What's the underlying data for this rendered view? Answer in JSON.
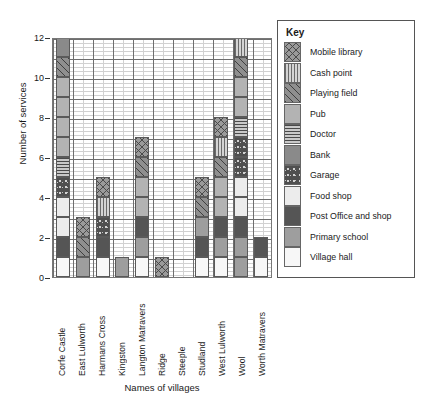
{
  "chart_data": {
    "type": "bar",
    "stacked": true,
    "title": "",
    "xlabel": "Names of villages",
    "ylabel": "Number of services",
    "ylim": [
      0,
      13
    ],
    "yticks": [
      0,
      2,
      4,
      6,
      8,
      10,
      12
    ],
    "grid": true,
    "legend_position": "right",
    "legend_title": "Key",
    "categories": [
      "Corfe Castle",
      "East Lulworth",
      "Harmans Cross",
      "Kingston",
      "Langton Matravers",
      "Ridge",
      "Steeple",
      "Studland",
      "West Lulworth",
      "Wool",
      "Worth Matravers"
    ],
    "totals": [
      12,
      3,
      5,
      1,
      7,
      1,
      0,
      5,
      8,
      12,
      2
    ],
    "series": [
      {
        "name": "Village hall",
        "key": "village-hall",
        "values": [
          1,
          0,
          1,
          0,
          1,
          0,
          0,
          1,
          1,
          0,
          1
        ]
      },
      {
        "name": "Primary school",
        "key": "primary-school",
        "values": [
          0,
          1,
          0,
          1,
          1,
          0,
          0,
          1,
          1,
          2,
          0
        ]
      },
      {
        "name": "Post Office and shop",
        "key": "post-office",
        "values": [
          1,
          0,
          1,
          0,
          1,
          0,
          0,
          1,
          1,
          1,
          1
        ]
      },
      {
        "name": "Food shop",
        "key": "food-shop",
        "values": [
          2,
          0,
          0,
          0,
          0,
          0,
          0,
          0,
          0,
          2,
          0
        ]
      },
      {
        "name": "Garage",
        "key": "garage",
        "values": [
          1,
          0,
          1,
          0,
          0,
          0,
          0,
          0,
          0,
          2,
          0
        ]
      },
      {
        "name": "Bank",
        "key": "bank",
        "values": [
          1,
          0,
          0,
          0,
          0,
          0,
          0,
          0,
          0,
          0,
          0
        ]
      },
      {
        "name": "Doctor",
        "key": "doctor",
        "values": [
          1,
          0,
          0,
          0,
          0,
          0,
          0,
          0,
          0,
          1,
          0
        ]
      },
      {
        "name": "Pub",
        "key": "pub",
        "values": [
          4,
          0,
          0,
          0,
          2,
          0,
          0,
          0,
          2,
          2,
          0
        ]
      },
      {
        "name": "Playing field",
        "key": "playing-field",
        "values": [
          1,
          1,
          0,
          0,
          1,
          0,
          0,
          1,
          1,
          1,
          0
        ]
      },
      {
        "name": "Cash point",
        "key": "cash-point",
        "values": [
          0,
          0,
          1,
          0,
          0,
          0,
          0,
          0,
          1,
          1,
          0
        ]
      },
      {
        "name": "Mobile library",
        "key": "mobile-library",
        "values": [
          0,
          1,
          1,
          0,
          1,
          1,
          0,
          1,
          1,
          0,
          0
        ]
      }
    ],
    "stacks": [
      {
        "village": "Corfe Castle",
        "segments": [
          "village-hall",
          "post-office",
          "food-shop",
          "food-shop",
          "garage",
          "doctor",
          "pub",
          "pub",
          "pub",
          "pub",
          "playing-field",
          "bank"
        ]
      },
      {
        "village": "East Lulworth",
        "segments": [
          "primary-school",
          "playing-field",
          "mobile-library"
        ]
      },
      {
        "village": "Harmans Cross",
        "segments": [
          "village-hall",
          "post-office",
          "garage",
          "cash-point",
          "mobile-library"
        ]
      },
      {
        "village": "Kingston",
        "segments": [
          "primary-school"
        ]
      },
      {
        "village": "Langton Matravers",
        "segments": [
          "village-hall",
          "primary-school",
          "post-office",
          "pub",
          "pub",
          "playing-field",
          "mobile-library"
        ]
      },
      {
        "village": "Ridge",
        "segments": [
          "mobile-library"
        ]
      },
      {
        "village": "Steeple",
        "segments": []
      },
      {
        "village": "Studland",
        "segments": [
          "village-hall",
          "post-office",
          "primary-school",
          "playing-field",
          "mobile-library"
        ]
      },
      {
        "village": "West Lulworth",
        "segments": [
          "village-hall",
          "primary-school",
          "post-office",
          "pub",
          "pub",
          "playing-field",
          "cash-point",
          "mobile-library"
        ]
      },
      {
        "village": "Wool",
        "segments": [
          "primary-school",
          "primary-school",
          "post-office",
          "food-shop",
          "food-shop",
          "garage",
          "garage",
          "doctor",
          "pub",
          "pub",
          "playing-field",
          "cash-point"
        ]
      },
      {
        "village": "Worth Matravers",
        "segments": [
          "village-hall",
          "post-office"
        ]
      }
    ]
  },
  "legend": {
    "title": "Key",
    "items": [
      {
        "label": "Mobile library",
        "key": "mobile-library"
      },
      {
        "label": "Cash point",
        "key": "cash-point"
      },
      {
        "label": "Playing field",
        "key": "playing-field"
      },
      {
        "label": "Pub",
        "key": "pub"
      },
      {
        "label": "Doctor",
        "key": "doctor"
      },
      {
        "label": "Bank",
        "key": "bank"
      },
      {
        "label": "Garage",
        "key": "garage"
      },
      {
        "label": "Food shop",
        "key": "food-shop"
      },
      {
        "label": "Post Office and shop",
        "key": "post-office"
      },
      {
        "label": "Primary school",
        "key": "primary-school"
      },
      {
        "label": "Village hall",
        "key": "village-hall"
      }
    ]
  },
  "axes": {
    "y_title": "Number of services",
    "x_title": "Names of villages",
    "y_tick_labels": [
      "0",
      "2",
      "4",
      "6",
      "8",
      "10",
      "12"
    ]
  }
}
